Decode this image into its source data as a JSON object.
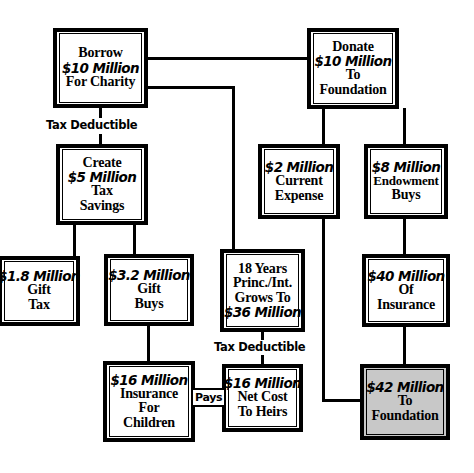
{
  "diagram": {
    "colors": {
      "background": "#ffffff",
      "stroke": "#000000",
      "shaded_fill": "#c8c8c8"
    },
    "nodes": [
      {
        "id": "borrow",
        "lines": [
          "Borrow",
          "$10 Million",
          "For Charity"
        ],
        "emphasis": [
          false,
          true,
          false
        ],
        "shaded": false
      },
      {
        "id": "donate",
        "lines": [
          "Donate",
          "$10 Million",
          "To",
          "Foundation"
        ],
        "emphasis": [
          false,
          true,
          false,
          false
        ],
        "shaded": false
      },
      {
        "id": "create-tax-savings",
        "lines": [
          "Create",
          "$5 Million",
          "Tax",
          "Savings"
        ],
        "emphasis": [
          false,
          true,
          false,
          false
        ],
        "shaded": false
      },
      {
        "id": "current-expense",
        "lines": [
          "$2 Million",
          "Current",
          "Expense"
        ],
        "emphasis": [
          true,
          false,
          false
        ],
        "shaded": false
      },
      {
        "id": "endowment-buys",
        "lines": [
          "$8 Million",
          "Endowment",
          "Buys"
        ],
        "emphasis": [
          true,
          false,
          false
        ],
        "shaded": false
      },
      {
        "id": "gift-tax",
        "lines": [
          "$1.8 Million",
          "Gift",
          "Tax"
        ],
        "emphasis": [
          true,
          false,
          false
        ],
        "shaded": false
      },
      {
        "id": "gift-buys",
        "lines": [
          "$3.2 Million",
          "Gift",
          "Buys"
        ],
        "emphasis": [
          true,
          false,
          false
        ],
        "shaded": false
      },
      {
        "id": "principal-interest-growth",
        "lines": [
          "18 Years",
          "Princ./Int.",
          "Grows To",
          "$36 Million"
        ],
        "emphasis": [
          false,
          false,
          false,
          true
        ],
        "shaded": false
      },
      {
        "id": "insurance-40m",
        "lines": [
          "$40 Million",
          "Of",
          "Insurance"
        ],
        "emphasis": [
          true,
          false,
          false
        ],
        "shaded": false
      },
      {
        "id": "insurance-for-children",
        "lines": [
          "$16 Million",
          "Insurance",
          "For",
          "Children"
        ],
        "emphasis": [
          true,
          false,
          false,
          false
        ],
        "shaded": false
      },
      {
        "id": "net-cost-to-heirs",
        "lines": [
          "$16 Million",
          "Net Cost",
          "To Heirs"
        ],
        "emphasis": [
          true,
          false,
          false
        ],
        "shaded": false
      },
      {
        "id": "to-foundation-42m",
        "lines": [
          "$42 Million",
          "To",
          "Foundation"
        ],
        "emphasis": [
          true,
          false,
          false
        ],
        "shaded": true
      }
    ],
    "edge_labels": [
      {
        "id": "tax-deductible-top",
        "text": "Tax Deductible"
      },
      {
        "id": "tax-deductible-mid",
        "text": "Tax Deductible"
      },
      {
        "id": "pays",
        "text": "Pays"
      }
    ]
  }
}
